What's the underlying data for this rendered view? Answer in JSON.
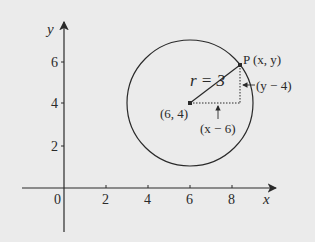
{
  "diagram": {
    "type": "coordinate-circle",
    "axes": {
      "x_label": "x",
      "y_label": "y",
      "origin_label": "0",
      "x_ticks": [
        "2",
        "4",
        "6",
        "8"
      ],
      "y_ticks": [
        "2",
        "4",
        "6"
      ]
    },
    "circle": {
      "center": [
        6,
        4
      ],
      "radius": 3,
      "center_label": "(6, 4)",
      "radius_label": "r = 3"
    },
    "point": {
      "name": "P",
      "label": "P (x, y)"
    },
    "annotations": {
      "vertical_leg": "(y − 4)",
      "horizontal_leg": "(x − 6)"
    },
    "colors": {
      "background": "#ebebeb",
      "ink": "#2a2a2a"
    }
  }
}
